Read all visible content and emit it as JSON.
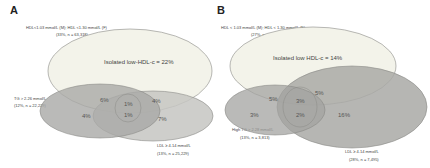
{
  "panels": [
    {
      "letter": "A",
      "hdl_label": "HDL<1.03 mmol/L (M); HDL <1.30 mmol/L (F)",
      "hdl_stats": "(33%, n = 63,318)",
      "tg_label": "TG > 2.26 mmol/L",
      "tg_stats": "(12%, n = 22,229)",
      "ldl_label": "LDL ≥ 4.14 mmol/L",
      "ldl_stats": "(13%, n = 25,229)",
      "main_region": "Isolated low-HDL-c = 22%",
      "regions": {
        "hdl_tg": "6%",
        "hdl_ldl": "4%",
        "all_three": "1%",
        "tg_ldl": "1%",
        "tg_only": "4%",
        "ldl_only": "7%"
      }
    },
    {
      "letter": "B",
      "hdl_label": "HDL < 1.03 mmol/L (M); HDL < 1.30 mmol/L (F)",
      "hdl_stats": "(27%, n = 7,794)",
      "tg_label": "High TG > 2.28 mmol/L",
      "tg_stats": "(13%, n = 3,813)",
      "ldl_label": "LDL ≥ 4.14 mmol/L",
      "ldl_stats": "(28%, n = 7,495)",
      "main_region": "Isolated low HDL-c = 14%",
      "regions": {
        "hdl_tg": "5%",
        "hdl_ldl": "5%",
        "all_three": "3%",
        "tg_ldl": "2%",
        "tg_only": "3%",
        "ldl_only": "16%"
      }
    }
  ],
  "colors": {
    "hdl_fill": "#f3f3ea",
    "tg_fill": "#a9a9a6",
    "ldl_fill": "#c6c6c2",
    "outline": "#8a8a86"
  }
}
